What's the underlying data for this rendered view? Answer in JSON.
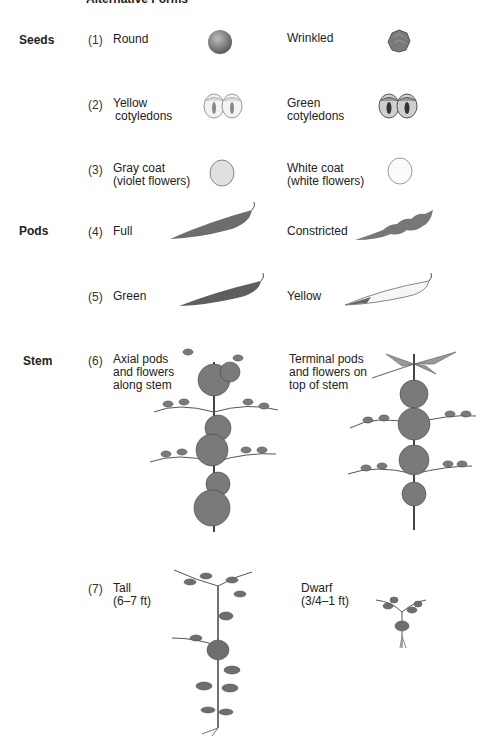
{
  "header": {
    "title": "Alternative Forms"
  },
  "categories": [
    {
      "label": "Seeds"
    },
    {
      "label": "Pods"
    },
    {
      "label": "Stem"
    }
  ],
  "traits": [
    {
      "number": "(1)",
      "form_a": "Round",
      "form_b": "Wrinkled",
      "category": "Seeds"
    },
    {
      "number": "(2)",
      "form_a_line1": "Yellow",
      "form_a_line2": "cotyledons",
      "form_b_line1": "Green",
      "form_b_line2": "cotyledons",
      "category": "Seeds"
    },
    {
      "number": "(3)",
      "form_a_line1": "Gray coat",
      "form_a_line2": "(violet flowers)",
      "form_b_line1": "White coat",
      "form_b_line2": "(white flowers)",
      "category": "Seeds"
    },
    {
      "number": "(4)",
      "form_a": "Full",
      "form_b": "Constricted",
      "category": "Pods"
    },
    {
      "number": "(5)",
      "form_a": "Green",
      "form_b": "Yellow",
      "category": "Pods"
    },
    {
      "number": "(6)",
      "form_a_line1": "Axial pods",
      "form_a_line2": "and flowers",
      "form_a_line3": "along stem",
      "form_b_line1": "Terminal pods",
      "form_b_line2": "and flowers on",
      "form_b_line3": "top of stem",
      "category": "Stem"
    },
    {
      "number": "(7)",
      "form_a_line1": "Tall",
      "form_a_line2": "(6–7 ft)",
      "form_b_line1": "Dwarf",
      "form_b_line2": "(3/4–1 ft)",
      "category": "Stem"
    }
  ],
  "illustrations": {
    "round_seed": "round-seed-icon",
    "wrinkled_seed": "wrinkled-seed-icon",
    "yellow_cotyledons": "yellow-cotyledons-icon",
    "green_cotyledons": "green-cotyledons-icon",
    "gray_coat": "gray-coat-seed-icon",
    "white_coat": "white-coat-seed-icon",
    "full_pod": "full-pod-icon",
    "constricted_pod": "constricted-pod-icon",
    "green_pod": "green-pod-icon",
    "yellow_pod": "yellow-pod-icon",
    "axial_plant": "axial-flowers-plant-icon",
    "terminal_plant": "terminal-flowers-plant-icon",
    "tall_plant": "tall-plant-icon",
    "dwarf_plant": "dwarf-plant-icon"
  },
  "colors": {
    "ink": "#222222",
    "dark_fill": "#6a6a6a",
    "mid_fill": "#8c8c8c",
    "light_fill": "#d8d8d8"
  }
}
